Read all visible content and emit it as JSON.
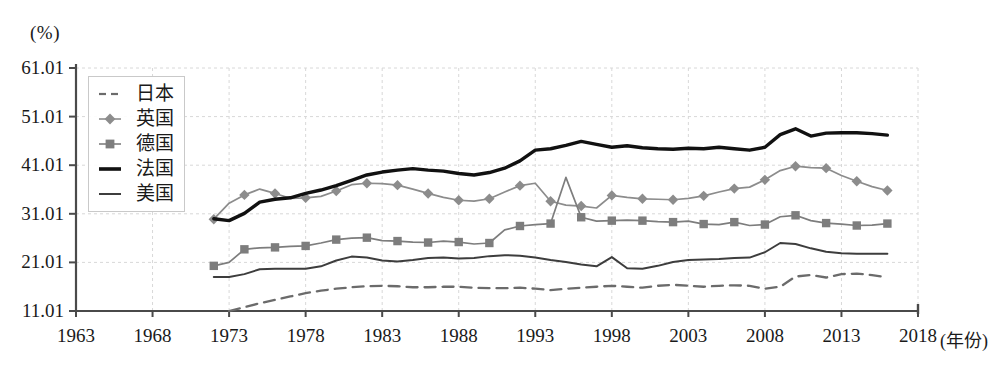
{
  "chart_data": {
    "type": "line",
    "title": "",
    "subtitle": "",
    "xlabel": "(年份)",
    "ylabel": "(%)",
    "xlim": [
      1963,
      2018
    ],
    "ylim": [
      11.01,
      61.01
    ],
    "x_ticks": [
      1963,
      1968,
      1973,
      1978,
      1983,
      1988,
      1993,
      1998,
      2003,
      2008,
      2013,
      2018
    ],
    "y_ticks": [
      11.01,
      21.01,
      31.01,
      41.01,
      51.01,
      61.01
    ],
    "grid": true,
    "legend_position": "upper-left-inside",
    "series": [
      {
        "name": "日本",
        "style": "dashed",
        "color": "#6b6b6b",
        "marker": "none",
        "x": [
          1973,
          1974,
          1975,
          1976,
          1977,
          1978,
          1979,
          1980,
          1981,
          1982,
          1983,
          1984,
          1985,
          1986,
          1987,
          1988,
          1989,
          1990,
          1991,
          1992,
          1993,
          1994,
          1995,
          1996,
          1997,
          1998,
          1999,
          2000,
          2001,
          2002,
          2003,
          2004,
          2005,
          2006,
          2007,
          2008,
          2009,
          2010,
          2011,
          2012,
          2013,
          2014,
          2015,
          2016
        ],
        "y": [
          11.01,
          11.8,
          12.6,
          13.3,
          14.0,
          14.7,
          15.2,
          15.6,
          15.9,
          16.1,
          16.2,
          16.1,
          15.9,
          15.9,
          16.0,
          16.0,
          15.8,
          15.7,
          15.7,
          15.8,
          15.6,
          15.3,
          15.6,
          15.8,
          16.0,
          16.2,
          16.0,
          15.8,
          16.2,
          16.4,
          16.2,
          16.0,
          16.2,
          16.3,
          16.2,
          15.6,
          16.0,
          18.1,
          18.4,
          17.9,
          18.6,
          18.7,
          18.4,
          17.9
        ]
      },
      {
        "name": "英国",
        "style": "solid-marker",
        "color": "#8c8c8c",
        "marker": "diamond",
        "x": [
          1972,
          1973,
          1974,
          1975,
          1976,
          1977,
          1978,
          1979,
          1980,
          1981,
          1982,
          1983,
          1984,
          1985,
          1986,
          1987,
          1988,
          1989,
          1990,
          1991,
          1992,
          1993,
          1994,
          1995,
          1996,
          1997,
          1998,
          1999,
          2000,
          2001,
          2002,
          2003,
          2004,
          2005,
          2006,
          2007,
          2008,
          2009,
          2010,
          2011,
          2012,
          2013,
          2014,
          2015,
          2016
        ],
        "y": [
          29.9,
          33.2,
          34.9,
          36.1,
          35.2,
          34.2,
          34.3,
          34.6,
          35.7,
          37.0,
          37.3,
          37.2,
          36.9,
          36.1,
          35.2,
          34.4,
          33.8,
          33.6,
          34.1,
          35.5,
          36.8,
          37.3,
          33.6,
          32.8,
          32.6,
          32.2,
          34.8,
          34.4,
          34.1,
          34.0,
          33.9,
          34.2,
          34.7,
          35.5,
          36.2,
          36.5,
          38.0,
          39.9,
          40.8,
          40.5,
          40.4,
          38.9,
          37.7,
          36.6,
          35.8
        ]
      },
      {
        "name": "德国",
        "style": "solid-marker",
        "color": "#7d7d7d",
        "marker": "square",
        "x": [
          1972,
          1973,
          1974,
          1975,
          1976,
          1977,
          1978,
          1979,
          1980,
          1981,
          1982,
          1983,
          1984,
          1985,
          1986,
          1987,
          1988,
          1989,
          1990,
          1991,
          1992,
          1993,
          1994,
          1995,
          1996,
          1997,
          1998,
          1999,
          2000,
          2001,
          2002,
          2003,
          2004,
          2005,
          2006,
          2007,
          2008,
          2009,
          2010,
          2011,
          2012,
          2013,
          2014,
          2015,
          2016
        ],
        "y": [
          20.3,
          21.0,
          23.7,
          24.0,
          24.1,
          24.3,
          24.4,
          25.0,
          25.7,
          26.0,
          26.1,
          25.5,
          25.4,
          25.2,
          25.1,
          25.4,
          25.2,
          24.8,
          25.0,
          27.7,
          28.5,
          28.8,
          29.0,
          38.5,
          30.3,
          29.5,
          29.6,
          29.7,
          29.6,
          29.4,
          29.3,
          29.5,
          28.9,
          28.8,
          29.3,
          28.6,
          28.8,
          30.4,
          30.7,
          29.6,
          29.1,
          28.9,
          28.6,
          28.7,
          29.0
        ]
      },
      {
        "name": "法国",
        "style": "solid-thick",
        "color": "#111111",
        "marker": "none",
        "x": [
          1972,
          1973,
          1974,
          1975,
          1976,
          1977,
          1978,
          1979,
          1980,
          1981,
          1982,
          1983,
          1984,
          1985,
          1986,
          1987,
          1988,
          1989,
          1990,
          1991,
          1992,
          1993,
          1994,
          1995,
          1996,
          1997,
          1998,
          1999,
          2000,
          2001,
          2002,
          2003,
          2004,
          2005,
          2006,
          2007,
          2008,
          2009,
          2010,
          2011,
          2012,
          2013,
          2014,
          2015,
          2016
        ],
        "y": [
          30.0,
          29.6,
          31.1,
          33.4,
          34.0,
          34.3,
          35.2,
          35.9,
          36.8,
          37.9,
          39.0,
          39.6,
          40.0,
          40.3,
          40.0,
          39.8,
          39.3,
          39.0,
          39.5,
          40.4,
          41.9,
          44.1,
          44.4,
          45.1,
          45.9,
          45.3,
          44.7,
          45.0,
          44.6,
          44.4,
          44.3,
          44.5,
          44.4,
          44.7,
          44.4,
          44.1,
          44.7,
          47.3,
          48.5,
          47.0,
          47.6,
          47.7,
          47.7,
          47.5,
          47.2
        ]
      },
      {
        "name": "美国",
        "style": "solid-thin",
        "color": "#3d3d3d",
        "marker": "none",
        "x": [
          1972,
          1973,
          1974,
          1975,
          1976,
          1977,
          1978,
          1979,
          1980,
          1981,
          1982,
          1983,
          1984,
          1985,
          1986,
          1987,
          1988,
          1989,
          1990,
          1991,
          1992,
          1993,
          1994,
          1995,
          1996,
          1997,
          1998,
          1999,
          2000,
          2001,
          2002,
          2003,
          2004,
          2005,
          2006,
          2007,
          2008,
          2009,
          2010,
          2011,
          2012,
          2013,
          2014,
          2015,
          2016
        ],
        "y": [
          18.0,
          18.0,
          18.6,
          19.6,
          19.7,
          19.7,
          19.7,
          20.2,
          21.4,
          22.2,
          22.0,
          21.4,
          21.2,
          21.5,
          21.9,
          22.0,
          21.8,
          21.9,
          22.3,
          22.5,
          22.4,
          22.0,
          21.5,
          21.1,
          20.6,
          20.2,
          22.1,
          19.8,
          19.7,
          20.3,
          21.1,
          21.5,
          21.6,
          21.7,
          21.9,
          22.0,
          23.1,
          25.0,
          24.8,
          23.9,
          23.2,
          22.9,
          22.8,
          22.8,
          22.8
        ]
      }
    ]
  },
  "axis": {
    "y_unit": "(%)",
    "x_unit": "(年份)",
    "y_labels": [
      "61.01",
      "51.01",
      "41.01",
      "31.01",
      "21.01",
      "11.01"
    ],
    "x_labels": [
      "1963",
      "1968",
      "1973",
      "1978",
      "1983",
      "1988",
      "1993",
      "1998",
      "2003",
      "2008",
      "2013",
      "2018"
    ]
  },
  "legend": {
    "entries": [
      {
        "label": "日本",
        "swatch": "dashed-line-swatch"
      },
      {
        "label": "英国",
        "swatch": "diamond-marker-line-swatch"
      },
      {
        "label": "德国",
        "swatch": "square-marker-line-swatch"
      },
      {
        "label": "法国",
        "swatch": "thick-line-swatch"
      },
      {
        "label": "美国",
        "swatch": "thin-line-swatch"
      }
    ]
  },
  "colors": {
    "japan": "#6b6b6b",
    "uk": "#8c8c8c",
    "germany": "#7d7d7d",
    "france": "#111111",
    "usa": "#3d3d3d",
    "grid": "#d8d8d8",
    "axis": "#4a4a4a"
  }
}
